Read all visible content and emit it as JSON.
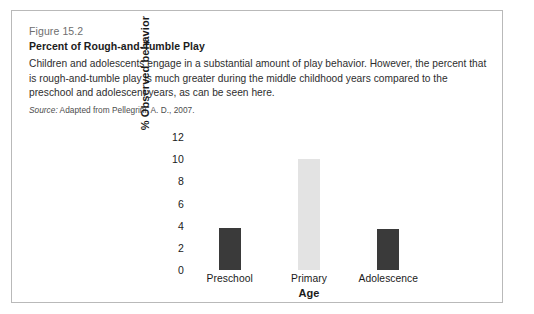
{
  "figure": {
    "number": "Figure 15.2",
    "title": "Percent of Rough-and-Tumble Play",
    "body": "Children and adolescents engage in a substantial amount of play behavior. However, the percent that is rough-and-tumble play is much greater during the middle childhood years compared to the preschool and adolescent years, as can be seen here.",
    "source_label": "Source:",
    "source_text": " Adapted from Pellegrini, A. D., 2007."
  },
  "chart_data": {
    "type": "bar",
    "title": "Percent of Rough-and-Tumble Play",
    "xlabel": "Age",
    "ylabel": "% Observed behavior",
    "categories": [
      "Preschool",
      "Primary",
      "Adolescence"
    ],
    "values": [
      3.8,
      10.0,
      3.7
    ],
    "bar_colors": [
      "#3a3a3a",
      "#e3e3e3",
      "#3a3a3a"
    ],
    "ylim": [
      0,
      12
    ],
    "yticks": [
      12,
      10,
      8,
      6,
      4,
      2,
      0
    ],
    "ytick_labels": [
      "12",
      "10",
      "8",
      "6",
      "4",
      "2",
      "0"
    ],
    "grid": false,
    "legend": false
  },
  "colors": {
    "border": "#b9b9b9",
    "bar_dark": "#3a3a3a",
    "bar_light": "#e3e3e3",
    "text": "#1a1a1a",
    "muted": "#6e6e6e"
  }
}
